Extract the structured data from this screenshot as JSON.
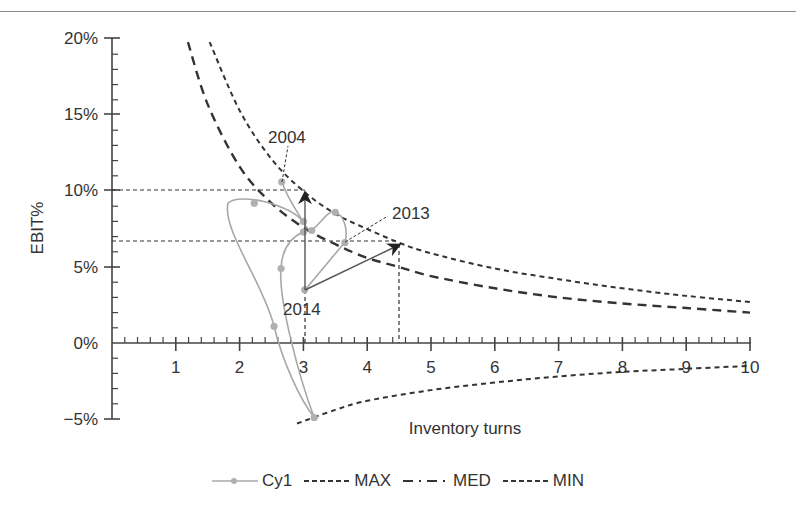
{
  "chart_data": {
    "type": "line",
    "title": "",
    "xlabel": "Inventory turns",
    "ylabel": "EBIT%",
    "xlim": [
      0,
      10
    ],
    "ylim": [
      -5,
      20
    ],
    "x_ticks": [
      "1",
      "2",
      "3",
      "4",
      "5",
      "6",
      "7",
      "8",
      "9",
      "10"
    ],
    "y_ticks": [
      "20%",
      "15%",
      "10%",
      "5%",
      "0%",
      "-5%"
    ],
    "grid": false,
    "legend_position": "bottom",
    "legend": [
      "Cy1",
      "MAX",
      "MED",
      "MIN"
    ],
    "series": [
      {
        "name": "Cy1",
        "style": "solid-gray-with-markers",
        "points": [
          {
            "x": 2.66,
            "y": 10.6,
            "label": "2004"
          },
          {
            "x": 3.0,
            "y": 8.0
          },
          {
            "x": 3.13,
            "y": 7.4
          },
          {
            "x": 3.5,
            "y": 8.6
          },
          {
            "x": 3.65,
            "y": 6.6,
            "label": "2013"
          },
          {
            "x": 3.02,
            "y": 3.5,
            "label": "2014"
          },
          {
            "x": 3.0,
            "y": 7.3
          },
          {
            "x": 2.65,
            "y": 4.9
          },
          {
            "x": 3.17,
            "y": -4.9
          },
          {
            "x": 2.54,
            "y": 1.1
          },
          {
            "x": 2.23,
            "y": 9.2
          }
        ]
      },
      {
        "name": "MAX",
        "style": "short-dash",
        "points": [
          {
            "x": 1.53,
            "y": 19.8
          },
          {
            "x": 2.0,
            "y": 15.3
          },
          {
            "x": 2.5,
            "y": 12.1
          },
          {
            "x": 3.0,
            "y": 10.0
          },
          {
            "x": 3.5,
            "y": 8.5
          },
          {
            "x": 4.0,
            "y": 7.5
          },
          {
            "x": 4.5,
            "y": 6.6
          },
          {
            "x": 5.0,
            "y": 5.9
          },
          {
            "x": 6.0,
            "y": 4.9
          },
          {
            "x": 7.0,
            "y": 4.2
          },
          {
            "x": 8.0,
            "y": 3.6
          },
          {
            "x": 9.0,
            "y": 3.1
          },
          {
            "x": 10.0,
            "y": 2.7
          }
        ]
      },
      {
        "name": "MED",
        "style": "long-dash",
        "points": [
          {
            "x": 1.19,
            "y": 19.8
          },
          {
            "x": 1.5,
            "y": 15.7
          },
          {
            "x": 2.0,
            "y": 11.6
          },
          {
            "x": 2.5,
            "y": 9.2
          },
          {
            "x": 3.0,
            "y": 7.6
          },
          {
            "x": 3.5,
            "y": 6.5
          },
          {
            "x": 4.0,
            "y": 5.6
          },
          {
            "x": 4.5,
            "y": 5.0
          },
          {
            "x": 5.0,
            "y": 4.4
          },
          {
            "x": 6.0,
            "y": 3.6
          },
          {
            "x": 7.0,
            "y": 3.0
          },
          {
            "x": 8.0,
            "y": 2.6
          },
          {
            "x": 9.0,
            "y": 2.3
          },
          {
            "x": 10.0,
            "y": 2.0
          }
        ]
      },
      {
        "name": "MIN",
        "style": "short-dash",
        "points": [
          {
            "x": 2.9,
            "y": -5.3
          },
          {
            "x": 3.5,
            "y": -4.4
          },
          {
            "x": 4.0,
            "y": -3.8
          },
          {
            "x": 5.0,
            "y": -3.1
          },
          {
            "x": 6.0,
            "y": -2.6
          },
          {
            "x": 7.0,
            "y": -2.2
          },
          {
            "x": 8.0,
            "y": -1.9
          },
          {
            "x": 9.0,
            "y": -1.7
          },
          {
            "x": 10.0,
            "y": -1.5
          }
        ]
      }
    ],
    "annotations": [
      {
        "type": "label",
        "text": "2004",
        "x": 2.66,
        "y": 10.6
      },
      {
        "type": "label",
        "text": "2013",
        "x": 3.65,
        "y": 6.6
      },
      {
        "type": "label",
        "text": "2014",
        "x": 3.02,
        "y": 3.5
      },
      {
        "type": "arrow",
        "from": {
          "x": 3.02,
          "y": 3.5
        },
        "to": {
          "x": 3.02,
          "y": 10.0
        }
      },
      {
        "type": "arrow",
        "from": {
          "x": 3.02,
          "y": 3.5
        },
        "to": {
          "x": 4.5,
          "y": 6.6
        }
      },
      {
        "type": "reference-line",
        "orientation": "horizontal",
        "y": 10.0,
        "x_to": 3.02
      },
      {
        "type": "reference-line",
        "orientation": "horizontal",
        "y": 6.7,
        "x_to": 4.5
      },
      {
        "type": "reference-line",
        "orientation": "vertical",
        "x": 3.02,
        "y_to": 0
      },
      {
        "type": "reference-line",
        "orientation": "vertical",
        "x": 4.5,
        "y_to": 0
      }
    ]
  },
  "labels": {
    "ylabel": "EBIT%",
    "xlabel": "Inventory turns",
    "y_ticks": [
      "20%",
      "15%",
      "10%",
      "5%",
      "0%",
      "−5%"
    ],
    "x_ticks": [
      "1",
      "2",
      "3",
      "4",
      "5",
      "6",
      "7",
      "8",
      "9",
      "10"
    ],
    "ann_2004": "2004",
    "ann_2013": "2013",
    "ann_2014": "2014"
  },
  "legend": {
    "items": [
      {
        "label": "Cy1"
      },
      {
        "label": "MAX"
      },
      {
        "label": "MED"
      },
      {
        "label": "MIN"
      }
    ]
  },
  "colors": {
    "cy1": "#a8a8a8",
    "curves": "#333333",
    "axis": "#444444"
  }
}
